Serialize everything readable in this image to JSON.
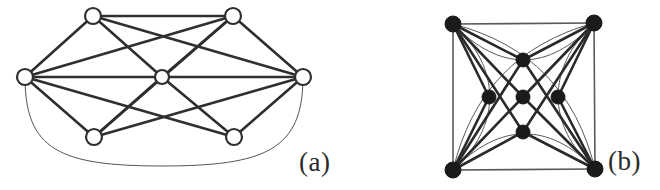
{
  "figure": {
    "background_color": "#ffffff",
    "stroke_color": "#2f2f2f",
    "vertex_fill_open": "#ffffff",
    "vertex_fill_solid": "#1a1a1a",
    "thick_edge_width": 2.6,
    "thin_edge_width": 1.0
  },
  "panels": [
    {
      "id": "a",
      "caption": "(a)",
      "vertex_style": "open-circle",
      "vertex_count": 7,
      "edge_count": 16,
      "vertices": [
        {
          "name": "left",
          "x": 25,
          "y": 77,
          "r": 8
        },
        {
          "name": "top-left",
          "x": 93,
          "y": 16,
          "r": 8
        },
        {
          "name": "center",
          "x": 162,
          "y": 77,
          "r": 7
        },
        {
          "name": "top-right",
          "x": 233,
          "y": 16,
          "r": 8
        },
        {
          "name": "right",
          "x": 303,
          "y": 77,
          "r": 8
        },
        {
          "name": "bottom-left",
          "x": 94,
          "y": 137,
          "r": 8
        },
        {
          "name": "bottom-right",
          "x": 234,
          "y": 137,
          "r": 8
        }
      ],
      "straight_edges": [
        [
          "left",
          "top-left"
        ],
        [
          "left",
          "center"
        ],
        [
          "left",
          "top-right"
        ],
        [
          "left",
          "bottom-left"
        ],
        [
          "left",
          "bottom-right"
        ],
        [
          "top-left",
          "center"
        ],
        [
          "top-left",
          "top-right"
        ],
        [
          "top-left",
          "right"
        ],
        [
          "center",
          "top-right"
        ],
        [
          "center",
          "right"
        ],
        [
          "center",
          "bottom-left"
        ],
        [
          "center",
          "bottom-right"
        ],
        [
          "top-right",
          "right"
        ],
        [
          "right",
          "bottom-left"
        ],
        [
          "right",
          "bottom-right"
        ],
        [
          "bottom-left",
          "top-right"
        ]
      ],
      "curved_edges": [
        {
          "from": "left",
          "to": "right",
          "style": "thin",
          "bow": "below"
        }
      ]
    },
    {
      "id": "b",
      "caption": "(b)",
      "vertex_style": "filled-circle",
      "vertex_count": 9,
      "edge_count": 24,
      "vertices": [
        {
          "name": "corner-top-left",
          "x": 453,
          "y": 24,
          "r": 8
        },
        {
          "name": "corner-top-right",
          "x": 594,
          "y": 23,
          "r": 8
        },
        {
          "name": "corner-bottom-left",
          "x": 453,
          "y": 170,
          "r": 8
        },
        {
          "name": "corner-bottom-right",
          "x": 595,
          "y": 169,
          "r": 8
        },
        {
          "name": "inner-top",
          "x": 523,
          "y": 60,
          "r": 7
        },
        {
          "name": "inner-left",
          "x": 489,
          "y": 97,
          "r": 7
        },
        {
          "name": "inner-center",
          "x": 523,
          "y": 97,
          "r": 7
        },
        {
          "name": "inner-right",
          "x": 558,
          "y": 97,
          "r": 7
        },
        {
          "name": "inner-bottom",
          "x": 523,
          "y": 132,
          "r": 7
        }
      ],
      "square_edges": [
        [
          "corner-top-left",
          "corner-top-right"
        ],
        [
          "corner-top-right",
          "corner-bottom-right"
        ],
        [
          "corner-bottom-right",
          "corner-bottom-left"
        ],
        [
          "corner-bottom-left",
          "corner-top-left"
        ]
      ],
      "straight_edges": [
        [
          "corner-top-left",
          "inner-top"
        ],
        [
          "corner-top-left",
          "inner-left"
        ],
        [
          "corner-top-left",
          "inner-center"
        ],
        [
          "corner-top-left",
          "inner-bottom"
        ],
        [
          "corner-top-right",
          "inner-top"
        ],
        [
          "corner-top-right",
          "inner-right"
        ],
        [
          "corner-top-right",
          "inner-center"
        ],
        [
          "corner-top-right",
          "inner-bottom"
        ],
        [
          "corner-bottom-left",
          "inner-bottom"
        ],
        [
          "corner-bottom-left",
          "inner-left"
        ],
        [
          "corner-bottom-left",
          "inner-center"
        ],
        [
          "corner-bottom-left",
          "inner-top"
        ],
        [
          "corner-bottom-right",
          "inner-bottom"
        ],
        [
          "corner-bottom-right",
          "inner-right"
        ],
        [
          "corner-bottom-right",
          "inner-center"
        ],
        [
          "corner-bottom-right",
          "inner-top"
        ]
      ],
      "curved_edges": [
        {
          "from": "corner-top-left",
          "to": "corner-top-right",
          "style": "thin",
          "bow": "below"
        },
        {
          "from": "corner-top-left",
          "to": "corner-bottom-left",
          "style": "thin",
          "bow": "right"
        },
        {
          "from": "corner-top-right",
          "to": "corner-bottom-right",
          "style": "thin",
          "bow": "left"
        },
        {
          "from": "corner-bottom-left",
          "to": "corner-bottom-right",
          "style": "thin",
          "bow": "above"
        },
        {
          "from": "corner-top-left",
          "to": "corner-bottom-right",
          "style": "thin",
          "bow": "right"
        },
        {
          "from": "corner-top-right",
          "to": "corner-bottom-left",
          "style": "thin",
          "bow": "left"
        }
      ]
    }
  ]
}
